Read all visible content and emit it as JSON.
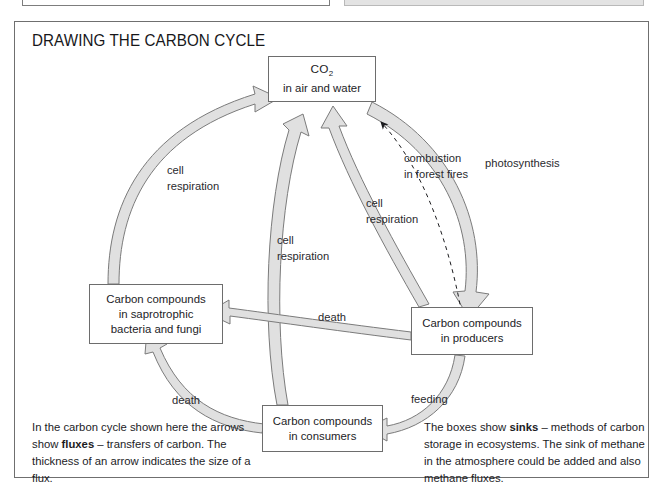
{
  "page": {
    "title": "DRAWING THE CARBON CYCLE"
  },
  "diagram": {
    "type": "carbon-cycle-flow-diagram",
    "nodes": [
      {
        "id": "co2",
        "lines": [
          "CO2",
          "in air and water"
        ],
        "label_html": "CO<sub>2</sub>"
      },
      {
        "id": "saprotrophs",
        "lines": [
          "Carbon compounds",
          "in saprotrophic",
          "bacteria and fungi"
        ]
      },
      {
        "id": "producers",
        "lines": [
          "Carbon compounds",
          "in producers"
        ]
      },
      {
        "id": "consumers",
        "lines": [
          "Carbon compounds",
          "in consumers"
        ]
      }
    ],
    "flux_labels": {
      "cell_respiration_left": {
        "line1": "cell",
        "line2": "respiration"
      },
      "cell_respiration_middle": {
        "line1": "cell",
        "line2": "respiration"
      },
      "cell_respiration_right": {
        "line1": "cell",
        "line2": "respiration"
      },
      "combustion": {
        "line1": "combustion",
        "line2": "in forest fires"
      },
      "photosynthesis": {
        "line1": "photosynthesis"
      },
      "death_top": {
        "line1": "death"
      },
      "death_bottom": {
        "line1": "death"
      },
      "feeding": {
        "line1": "feeding"
      }
    },
    "arrows": [
      {
        "from": "saprotrophs",
        "to": "co2",
        "label": "cell respiration",
        "style": "solid-thick"
      },
      {
        "from": "consumers",
        "to": "co2",
        "label": "cell respiration",
        "style": "solid-thick"
      },
      {
        "from": "producers",
        "to": "co2",
        "label": "cell respiration",
        "style": "solid-thick"
      },
      {
        "from": "producers",
        "to": "co2",
        "label": "combustion in forest fires",
        "style": "dashed-thin"
      },
      {
        "from": "co2",
        "to": "producers",
        "label": "photosynthesis",
        "style": "solid-very-thick"
      },
      {
        "from": "producers",
        "to": "saprotrophs",
        "label": "death",
        "style": "solid-medium"
      },
      {
        "from": "consumers",
        "to": "saprotrophs",
        "label": "death",
        "style": "solid-medium"
      },
      {
        "from": "producers",
        "to": "consumers",
        "label": "feeding",
        "style": "solid-medium"
      }
    ],
    "colors": {
      "arrow_fill": "#e0e0e0",
      "arrow_stroke": "#7b7b7b",
      "box_stroke": "#6d6d6d",
      "text": "#1c1c1f",
      "frame": "#6f6f6f"
    }
  },
  "captions": {
    "left": {
      "part1": "In the carbon cycle shown here the arrows show ",
      "bold": "fluxes",
      "part2": " – transfers of carbon. The thickness of an arrow indicates the size of a flux."
    },
    "right": {
      "part1": "The boxes show ",
      "bold": "sinks",
      "part2": " – methods of carbon storage in ecosystems. The sink of methane in the atmosphere could be added and also methane fluxes."
    }
  }
}
